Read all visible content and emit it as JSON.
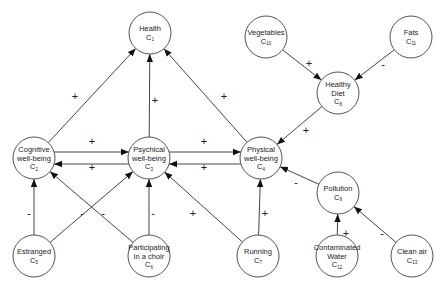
{
  "diagram": {
    "type": "fuzzy-cognitive-map",
    "node_radius": 21,
    "colors": {
      "stroke": "#555555",
      "fill": "#ffffff",
      "text": "#222222",
      "edge": "#444444"
    },
    "nodes": [
      {
        "id": "C1",
        "lines": [
          "Health"
        ],
        "sub": "1",
        "x": 150,
        "y": 33
      },
      {
        "id": "C2",
        "lines": [
          "Cognitive",
          "well-being"
        ],
        "sub": "2",
        "x": 34,
        "y": 158
      },
      {
        "id": "C3",
        "lines": [
          "Psychical",
          "well-being"
        ],
        "sub": "3",
        "x": 149,
        "y": 158
      },
      {
        "id": "C4",
        "lines": [
          "Physical",
          "well-being"
        ],
        "sub": "4",
        "x": 261,
        "y": 158
      },
      {
        "id": "C5",
        "lines": [
          "Estranged"
        ],
        "sub": "5",
        "x": 34,
        "y": 256
      },
      {
        "id": "C6",
        "lines": [
          "Participating",
          "in a choir"
        ],
        "sub": "6",
        "x": 149,
        "y": 256
      },
      {
        "id": "C7",
        "lines": [
          "Running"
        ],
        "sub": "7",
        "x": 258,
        "y": 256
      },
      {
        "id": "C8",
        "lines": [
          "Healthy",
          "Diet"
        ],
        "sub": "8",
        "x": 338,
        "y": 93
      },
      {
        "id": "C9",
        "lines": [
          "Pollution"
        ],
        "sub": "9",
        "x": 338,
        "y": 193
      },
      {
        "id": "C10",
        "lines": [
          "Vegetables"
        ],
        "sub": "10",
        "x": 266,
        "y": 37
      },
      {
        "id": "C11",
        "lines": [
          "Fats"
        ],
        "sub": "11",
        "x": 411,
        "y": 37
      },
      {
        "id": "C12",
        "lines": [
          "Contaminated",
          "Water"
        ],
        "sub": "12",
        "x": 337,
        "y": 256
      },
      {
        "id": "C13",
        "lines": [
          "Clean air"
        ],
        "sub": "13",
        "x": 412,
        "y": 256
      }
    ],
    "edges": [
      {
        "from": "C2",
        "to": "C1",
        "sign": "+",
        "lx": 75,
        "ly": 96
      },
      {
        "from": "C3",
        "to": "C1",
        "sign": "+",
        "lx": 155,
        "ly": 100
      },
      {
        "from": "C4",
        "to": "C1",
        "sign": "+",
        "lx": 224,
        "ly": 96
      },
      {
        "from": "C2",
        "to": "C3",
        "sign": "+",
        "lx": 92,
        "ly": 141,
        "dy": -6
      },
      {
        "from": "C3",
        "to": "C2",
        "sign": "+",
        "lx": 92,
        "ly": 167,
        "dy": 6
      },
      {
        "from": "C3",
        "to": "C4",
        "sign": "+",
        "lx": 204,
        "ly": 141,
        "dy": -6
      },
      {
        "from": "C4",
        "to": "C3",
        "sign": "+",
        "lx": 204,
        "ly": 167,
        "dy": 6
      },
      {
        "from": "C5",
        "to": "C2",
        "sign": "-",
        "lx": 29,
        "ly": 213
      },
      {
        "from": "C5",
        "to": "C3",
        "sign": "-",
        "lx": 82,
        "ly": 213
      },
      {
        "from": "C6",
        "to": "C2",
        "sign": "-",
        "lx": 103,
        "ly": 213
      },
      {
        "from": "C6",
        "to": "C3",
        "sign": "-",
        "lx": 153,
        "ly": 213
      },
      {
        "from": "C7",
        "to": "C3",
        "sign": "+",
        "lx": 193,
        "ly": 213
      },
      {
        "from": "C7",
        "to": "C4",
        "sign": "+",
        "lx": 265,
        "ly": 213
      },
      {
        "from": "C8",
        "to": "C4",
        "sign": "+",
        "lx": 306,
        "ly": 130
      },
      {
        "from": "C9",
        "to": "C4",
        "sign": "-",
        "lx": 296,
        "ly": 182
      },
      {
        "from": "C10",
        "to": "C8",
        "sign": "+",
        "lx": 309,
        "ly": 63
      },
      {
        "from": "C11",
        "to": "C8",
        "sign": "-",
        "lx": 383,
        "ly": 64
      },
      {
        "from": "C12",
        "to": "C9",
        "sign": "+",
        "lx": 346,
        "ly": 233
      },
      {
        "from": "C13",
        "to": "C9",
        "sign": "-",
        "lx": 382,
        "ly": 233
      }
    ]
  }
}
